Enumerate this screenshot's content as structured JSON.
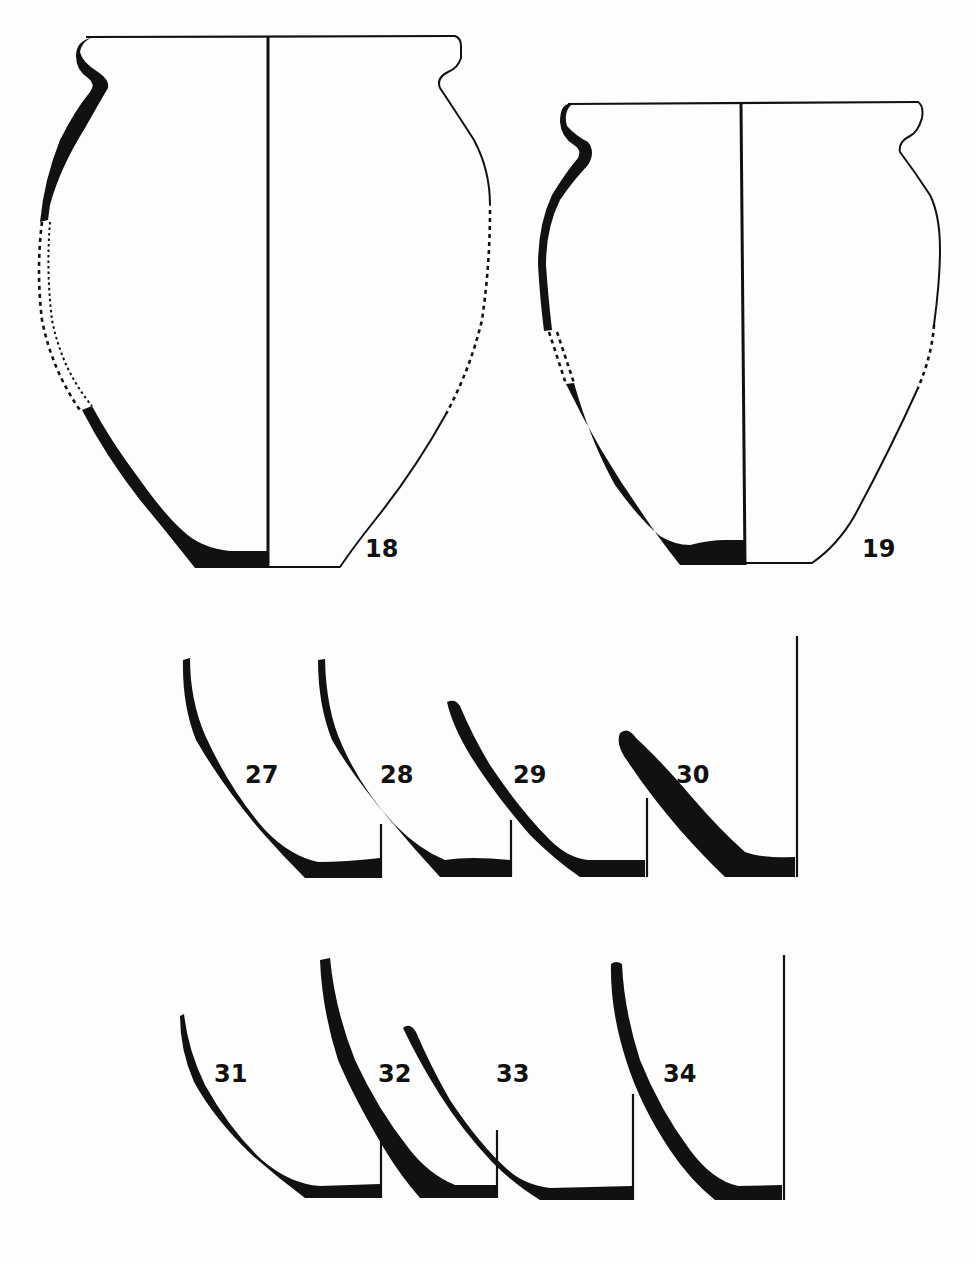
{
  "figure": {
    "colors": {
      "ink": "#111111",
      "paper": "#fdfdfb"
    },
    "vessels": [
      {
        "id": "vessel-18",
        "label": "18",
        "type": "full-profile jar with everted rim",
        "reconstructed_sections": "dashed"
      },
      {
        "id": "vessel-19",
        "label": "19",
        "type": "full-profile jar with everted rim",
        "reconstructed_sections": "dashed"
      }
    ],
    "fragments": [
      {
        "id": "fragment-27",
        "label": "27",
        "type": "base sherd",
        "row": 1
      },
      {
        "id": "fragment-28",
        "label": "28",
        "type": "base sherd",
        "row": 1
      },
      {
        "id": "fragment-29",
        "label": "29",
        "type": "base sherd",
        "row": 1
      },
      {
        "id": "fragment-30",
        "label": "30",
        "type": "base sherd",
        "row": 1
      },
      {
        "id": "fragment-31",
        "label": "31",
        "type": "base sherd",
        "row": 2
      },
      {
        "id": "fragment-32",
        "label": "32",
        "type": "base sherd",
        "row": 2
      },
      {
        "id": "fragment-33",
        "label": "33",
        "type": "base sherd",
        "row": 2
      },
      {
        "id": "fragment-34",
        "label": "34",
        "type": "base sherd",
        "row": 2
      }
    ]
  }
}
